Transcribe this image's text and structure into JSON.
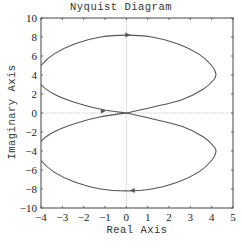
{
  "chart_data": {
    "type": "line",
    "title": "Nyquist Diagram",
    "xlabel": "Real Axis",
    "ylabel": "Imaginary Axis",
    "xlim": [
      -4,
      5
    ],
    "ylim": [
      -10,
      10
    ],
    "xticks": [
      -4,
      -3,
      -2,
      -1,
      0,
      1,
      2,
      3,
      4,
      5
    ],
    "yticks": [
      -10,
      -8,
      -6,
      -4,
      -2,
      0,
      2,
      4,
      6,
      8,
      10
    ],
    "grid": false,
    "zero_lines": true,
    "line_color": "#555555",
    "series": [
      {
        "name": "positive-frequency branch (upper lobe)",
        "shape": "closed lobe",
        "center": [
          0.1,
          4.1
        ],
        "real_range": [
          -4.0,
          4.2
        ],
        "imag_range": [
          0.0,
          8.2
        ],
        "points": [
          [
            0,
            0
          ],
          [
            1.2,
            0.6
          ],
          [
            2.6,
            1.4
          ],
          [
            3.6,
            2.5
          ],
          [
            4.1,
            3.5
          ],
          [
            4.2,
            4.1
          ],
          [
            4.0,
            5.0
          ],
          [
            3.4,
            6.2
          ],
          [
            2.4,
            7.3
          ],
          [
            1.2,
            8.0
          ],
          [
            0,
            8.2
          ],
          [
            -1.2,
            8.0
          ],
          [
            -2.4,
            7.3
          ],
          [
            -3.4,
            6.2
          ],
          [
            -4.0,
            5.0
          ],
          [
            -4.2,
            4.1
          ],
          [
            -4.0,
            3.0
          ],
          [
            -3.4,
            2.0
          ],
          [
            -2.4,
            1.1
          ],
          [
            -1.2,
            0.4
          ],
          [
            0,
            0
          ]
        ],
        "arrows": [
          {
            "at": [
              0.05,
              8.2
            ],
            "direction": "right"
          },
          {
            "at": [
              -1.1,
              0.2
            ],
            "direction": "right"
          }
        ]
      },
      {
        "name": "negative-frequency branch (lower lobe)",
        "shape": "closed lobe",
        "center": [
          0.1,
          -4.1
        ],
        "real_range": [
          -4.0,
          4.2
        ],
        "imag_range": [
          -8.2,
          0.0
        ],
        "points": [
          [
            0,
            0
          ],
          [
            1.2,
            -0.6
          ],
          [
            2.6,
            -1.4
          ],
          [
            3.6,
            -2.5
          ],
          [
            4.1,
            -3.5
          ],
          [
            4.2,
            -4.1
          ],
          [
            4.0,
            -5.0
          ],
          [
            3.4,
            -6.2
          ],
          [
            2.4,
            -7.3
          ],
          [
            1.2,
            -8.0
          ],
          [
            0,
            -8.2
          ],
          [
            -1.2,
            -8.0
          ],
          [
            -2.4,
            -7.3
          ],
          [
            -3.4,
            -6.2
          ],
          [
            -4.0,
            -5.0
          ],
          [
            -4.2,
            -4.1
          ],
          [
            -4.0,
            -3.0
          ],
          [
            -3.4,
            -2.0
          ],
          [
            -2.4,
            -1.1
          ],
          [
            -1.2,
            -0.4
          ],
          [
            0,
            0
          ]
        ],
        "arrows": [
          {
            "at": [
              0.3,
              -8.15
            ],
            "direction": "left"
          }
        ]
      }
    ]
  }
}
